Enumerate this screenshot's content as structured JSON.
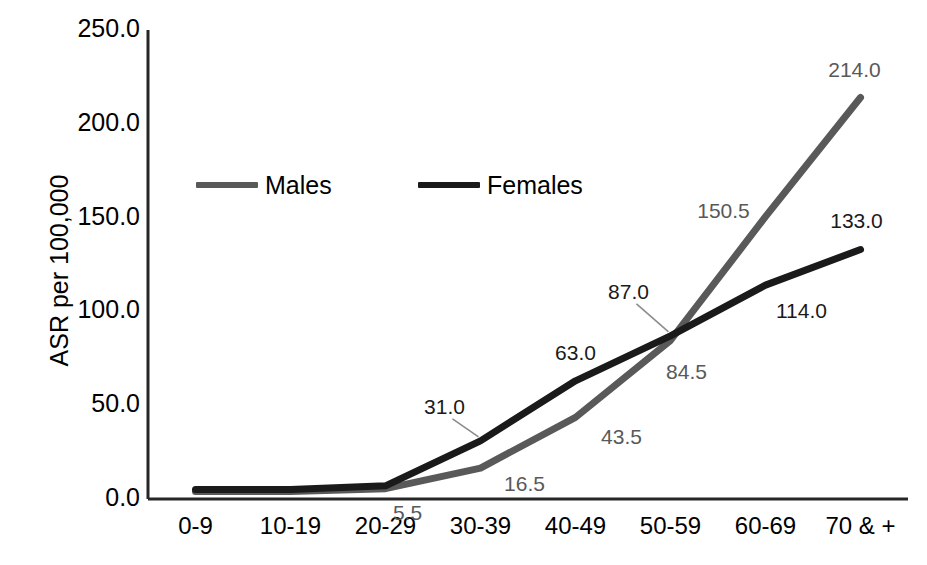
{
  "chart_data": {
    "type": "line",
    "title": "",
    "xlabel": "",
    "ylabel": "ASR per 100,000",
    "categories": [
      "0-9",
      "10-19",
      "20-29",
      "30-39",
      "40-49",
      "50-59",
      "60-69",
      "70 & +"
    ],
    "ylim": [
      0,
      250
    ],
    "yticks": [
      0,
      50,
      100,
      150,
      200,
      250
    ],
    "ytick_labels": [
      "0.0",
      "50.0",
      "100.0",
      "150.0",
      "200.0",
      "250.0"
    ],
    "grid": false,
    "legend_position": "upper-left-inside",
    "series": [
      {
        "name": "Males",
        "color": "#595959",
        "values": [
          4.0,
          4.0,
          5.5,
          16.5,
          43.5,
          84.5,
          150.5,
          214.0
        ],
        "labels": [
          "",
          "",
          "5.5",
          "16.5",
          "43.5",
          "84.5",
          "150.5",
          "214.0"
        ]
      },
      {
        "name": "Females",
        "color": "#1a1a1a",
        "values": [
          5.0,
          5.0,
          7.0,
          31.0,
          63.0,
          87.0,
          114.0,
          133.0
        ],
        "labels": [
          "",
          "",
          "",
          "31.0",
          "63.0",
          "87.0",
          "114.0",
          "133.0"
        ]
      }
    ],
    "annotations": [
      {
        "text": "5.5",
        "series": "Males",
        "category": "20-29",
        "value": 5.5,
        "color": "#595959"
      },
      {
        "text": "16.5",
        "series": "Males",
        "category": "30-39",
        "value": 16.5,
        "color": "#595959"
      },
      {
        "text": "43.5",
        "series": "Males",
        "category": "40-49",
        "value": 43.5,
        "color": "#595959"
      },
      {
        "text": "84.5",
        "series": "Males",
        "category": "50-59",
        "value": 84.5,
        "color": "#595959"
      },
      {
        "text": "150.5",
        "series": "Males",
        "category": "60-69",
        "value": 150.5,
        "color": "#595959"
      },
      {
        "text": "214.0",
        "series": "Males",
        "category": "70 & +",
        "value": 214.0,
        "color": "#595959"
      },
      {
        "text": "31.0",
        "series": "Females",
        "category": "30-39",
        "value": 31.0,
        "color": "#1a1a1a"
      },
      {
        "text": "63.0",
        "series": "Females",
        "category": "40-49",
        "value": 63.0,
        "color": "#1a1a1a"
      },
      {
        "text": "87.0",
        "series": "Females",
        "category": "50-59",
        "value": 87.0,
        "color": "#1a1a1a"
      },
      {
        "text": "114.0",
        "series": "Females",
        "category": "60-69",
        "value": 114.0,
        "color": "#1a1a1a"
      },
      {
        "text": "133.0",
        "series": "Females",
        "category": "70 & +",
        "value": 133.0,
        "color": "#1a1a1a"
      }
    ]
  },
  "legend": {
    "items": [
      {
        "label": "Males",
        "color": "#595959"
      },
      {
        "label": "Females",
        "color": "#1a1a1a"
      }
    ]
  },
  "axes": {
    "y_title": "ASR per 100,000",
    "axis_color": "#262626"
  }
}
